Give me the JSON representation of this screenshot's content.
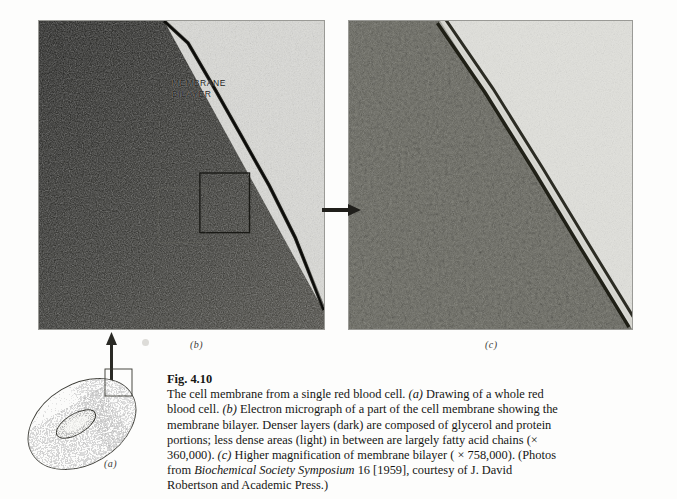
{
  "figure": {
    "number": "Fig. 4.10",
    "caption_text": "The cell membrane from a single red blood cell. (a) Drawing of a whole red blood cell. (b) Electron micrograph of a part of the cell membrane showing the membrane bilayer. Denser layers (dark) are composed of glycerol and protein portions; less dense areas (light) in between are largely fatty acid chains (× 360,000). (c) Higher magnification of membrane bilayer ( × 758,000). (Photos from Biochemical Society Symposium 16 [1959], courtesy of J. David Robertson and Academic Press.)",
    "caption_segments": [
      {
        "text": "The cell membrane from a single red blood cell. ",
        "style": "normal"
      },
      {
        "text": "(a)",
        "style": "italic"
      },
      {
        "text": " Drawing of a whole red blood cell. ",
        "style": "normal"
      },
      {
        "text": "(b)",
        "style": "italic"
      },
      {
        "text": " Electron micrograph of a part of the cell membrane showing the membrane bilayer. Denser layers (dark) are composed of glycerol and protein portions; less dense areas (light) in between are largely fatty acid chains (× 360,000). ",
        "style": "normal"
      },
      {
        "text": "(c)",
        "style": "italic"
      },
      {
        "text": " Higher magnification of membrane bilayer ( × 758,000). (Photos from ",
        "style": "normal"
      },
      {
        "text": "Biochemical Society Symposium",
        "style": "italic"
      },
      {
        "text": " 16 [1959], courtesy of J. David Robertson and Academic Press.)",
        "style": "normal"
      }
    ],
    "magnifications": {
      "panel_b": "× 360,000",
      "panel_c": "× 758,000"
    },
    "source": {
      "publication": "Biochemical Society Symposium",
      "volume": "16",
      "year": "[1959]",
      "credit": "courtesy of J. David Robertson and Academic Press."
    }
  },
  "panels": [
    {
      "id": "a",
      "letter": "(a)",
      "type": "line-drawing",
      "subject": "whole red blood cell",
      "description": "stippled biconcave disc with callout box at upper right"
    },
    {
      "id": "b",
      "letter": "(b)",
      "type": "electron-micrograph",
      "subject": "part of the cell membrane showing the membrane bilayer",
      "annotation": "MEMBRANE\nBILAYER",
      "annotation_line1": "MEMBRANE",
      "annotation_line2": "BILAYER"
    },
    {
      "id": "c",
      "letter": "(c)",
      "type": "electron-micrograph",
      "subject": "higher magnification of membrane bilayer"
    }
  ],
  "arrows": [
    {
      "name": "arrow-a-to-b",
      "from": "a",
      "to": "b",
      "direction": "up"
    },
    {
      "name": "arrow-b-to-c",
      "from": "b",
      "to": "c",
      "direction": "right"
    }
  ],
  "colors": {
    "page_background": "#fdfdfc",
    "panel_border": "#9a9a96",
    "ink": "#161614",
    "micrograph_dark": "#2b2b28",
    "micrograph_light": "#dcdcd6"
  }
}
